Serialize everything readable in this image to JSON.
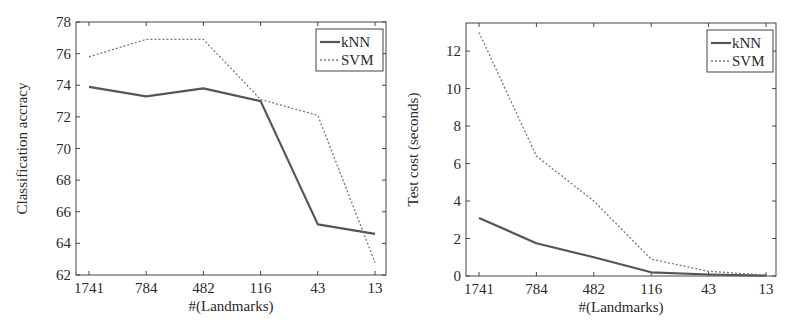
{
  "chart_data": [
    {
      "type": "line",
      "title": "",
      "xlabel": "#(Landmarks)",
      "ylabel": "Classification accracy",
      "categories": [
        "1741",
        "784",
        "482",
        "116",
        "43",
        "13"
      ],
      "ylim": [
        62,
        78
      ],
      "yticks": [
        62,
        64,
        66,
        68,
        70,
        72,
        74,
        76,
        78
      ],
      "grid": false,
      "legend_position": "upper right",
      "series": [
        {
          "name": "kNN",
          "style": "solid",
          "values": [
            73.9,
            73.3,
            73.8,
            73.0,
            65.2,
            64.6
          ]
        },
        {
          "name": "SVM",
          "style": "dotted",
          "values": [
            75.8,
            76.9,
            76.9,
            73.1,
            72.1,
            62.8
          ]
        }
      ]
    },
    {
      "type": "line",
      "title": "",
      "xlabel": "#(Landmarks)",
      "ylabel": "Test cost (seconds)",
      "categories": [
        "1741",
        "784",
        "482",
        "116",
        "43",
        "13"
      ],
      "ylim": [
        0,
        13.5
      ],
      "yticks": [
        0,
        2,
        4,
        6,
        8,
        10,
        12
      ],
      "grid": false,
      "legend_position": "upper right",
      "series": [
        {
          "name": "kNN",
          "style": "solid",
          "values": [
            3.1,
            1.75,
            1.0,
            0.2,
            0.08,
            0.02
          ]
        },
        {
          "name": "SVM",
          "style": "dotted",
          "values": [
            13.0,
            6.4,
            4.0,
            0.9,
            0.25,
            0.05
          ]
        }
      ]
    }
  ],
  "colors": {
    "line": "#555555",
    "axis": "#444444",
    "background": "#ffffff"
  }
}
